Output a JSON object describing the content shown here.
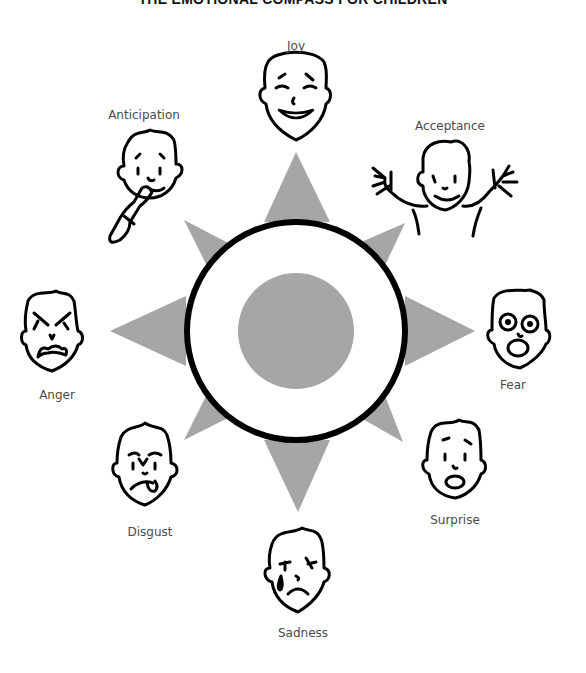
{
  "title": "THE EMOTIONAL COMPASS FOR CHILDREN",
  "colors": {
    "star": "#a6a6a6",
    "center_disc": "#a6a6a6",
    "ring": "#000000",
    "label": "#4a4a4a",
    "line": "#000000"
  },
  "compass": {
    "center": [
      296,
      331
    ],
    "ring_radius": 112,
    "inner_radius": 58
  },
  "emotions": [
    {
      "id": "joy",
      "label": "Joy",
      "face": "smiling with closed happy eyes"
    },
    {
      "id": "acceptance",
      "label": "Acceptance",
      "face": "smiling with arms raised"
    },
    {
      "id": "fear",
      "label": "Fear",
      "face": "wide eyes, open mouth"
    },
    {
      "id": "surprise",
      "label": "Surprise",
      "face": "raised brows, round mouth"
    },
    {
      "id": "sadness",
      "label": "Sadness",
      "face": "tear, frown"
    },
    {
      "id": "disgust",
      "label": "Disgust",
      "face": "furrowed brows, tongue out"
    },
    {
      "id": "anger",
      "label": "Anger",
      "face": "angry brows, snarl"
    },
    {
      "id": "anticipation",
      "label": "Anticipation",
      "face": "finger on lips, thinking"
    }
  ]
}
